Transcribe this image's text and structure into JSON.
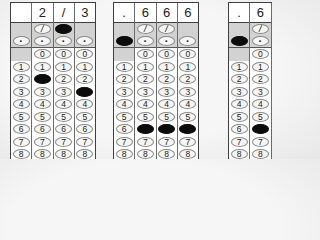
{
  "page": {
    "background": "#f6f6f6"
  },
  "sheet": {
    "columns": 4,
    "digit_rows": [
      "0",
      "1",
      "2",
      "3",
      "4",
      "5",
      "6",
      "7",
      "8"
    ],
    "slash_symbol": "/",
    "decimal_symbol": "·",
    "colors": {
      "card_bg": "#ffffff",
      "band_bg": "#d2d2d2",
      "line": "#3f3f3f",
      "bubble_outline": "#8a8a8a",
      "bubble_fill": "#0c0c0c",
      "text": "#222222"
    }
  },
  "grids": [
    {
      "id": "grid-1",
      "answer": [
        "",
        "2",
        "/",
        "3"
      ],
      "filled": [
        [
          "slash",
          2
        ],
        [
          "2",
          1
        ],
        [
          "3",
          3
        ]
      ]
    },
    {
      "id": "grid-2",
      "answer": [
        ".",
        "6",
        "6",
        "6"
      ],
      "filled": [
        [
          "decimal",
          0
        ],
        [
          "6",
          1
        ],
        [
          "6",
          2
        ],
        [
          "6",
          3
        ]
      ]
    },
    {
      "id": "grid-3",
      "answer": [
        ".",
        "6",
        "",
        ""
      ],
      "filled": [
        [
          "decimal",
          0
        ],
        [
          "6",
          1
        ],
        [
          "6",
          2
        ]
      ]
    }
  ]
}
